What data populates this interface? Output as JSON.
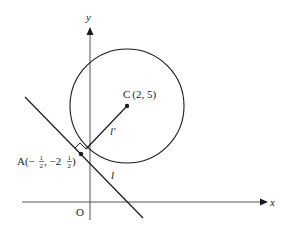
{
  "diagram": {
    "axes": {
      "x_label": "x",
      "y_label": "y",
      "origin_label": "O"
    },
    "circle": {
      "center_label": "C",
      "center_coords": "(2, 5)"
    },
    "point_a": {
      "label": "A",
      "coords_prefix": "(−",
      "x_frac_num": "1",
      "x_frac_den": "2",
      "sep": ", −2",
      "y_frac_num": "1",
      "y_frac_den": "2",
      "coords_suffix": ")"
    },
    "lines": {
      "tangent_label": "l",
      "radius_label": "l′"
    },
    "colors": {
      "stroke": "#1a1a1a",
      "axis": "#555555",
      "background": "#ffffff"
    }
  }
}
